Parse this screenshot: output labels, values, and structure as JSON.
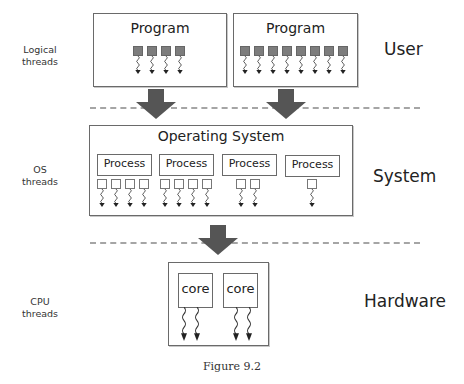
{
  "figure": {
    "caption": "Figure 9.2"
  },
  "side_labels": {
    "logical": "Logical threads",
    "logical_line1": "Logical",
    "logical_line2": "threads",
    "os_line1": "OS",
    "os_line2": "threads",
    "cpu_line1": "CPU",
    "cpu_line2": "threads"
  },
  "layer_labels": {
    "user": "User",
    "system": "System",
    "hardware": "Hardware"
  },
  "user_layer": {
    "programs": [
      {
        "title": "Program",
        "thread_count": 4
      },
      {
        "title": "Program",
        "thread_count": 8
      }
    ]
  },
  "system_layer": {
    "title": "Operating System",
    "processes": [
      {
        "label": "Process",
        "thread_count": 4
      },
      {
        "label": "Process",
        "thread_count": 4
      },
      {
        "label": "Process",
        "thread_count": 2
      },
      {
        "label": "Process",
        "thread_count": 1
      }
    ]
  },
  "hardware_layer": {
    "cores": [
      {
        "label": "core",
        "thread_count": 2
      },
      {
        "label": "core",
        "thread_count": 2
      }
    ]
  },
  "colors": {
    "arrow": "#555555",
    "dashed_separator": "#a5a5a5",
    "thread_square": "#7d7d7d",
    "box_border": "#6a6a6a"
  }
}
